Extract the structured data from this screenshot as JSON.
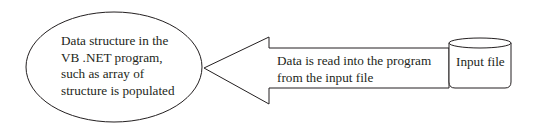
{
  "diagram": {
    "type": "data-flow",
    "nodes": {
      "data_structure": {
        "shape": "ellipse",
        "lines": [
          "Data structure in the",
          "VB .NET program,",
          "such as array of",
          "structure is populated"
        ]
      },
      "input_file": {
        "shape": "cylinder",
        "label": "Input file"
      }
    },
    "edges": [
      {
        "from": "input_file",
        "to": "data_structure",
        "shape": "block-arrow",
        "lines": [
          "Data is read into the program",
          "from the input file"
        ]
      }
    ],
    "colors": {
      "stroke": "#231f20",
      "background": "#ffffff",
      "text": "#231f20"
    }
  }
}
